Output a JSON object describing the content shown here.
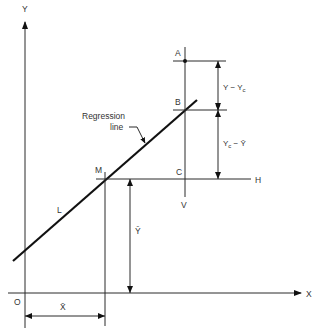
{
  "diagram": {
    "colors": {
      "line": "#111111",
      "thin": "#2a2a2a",
      "text": "#333333",
      "background": "#ffffff"
    },
    "axes": {
      "y_label": "Y",
      "x_label": "X",
      "origin_label": "O"
    },
    "points": {
      "A": "A",
      "B": "B",
      "C": "C",
      "M": "M"
    },
    "lines": {
      "regression_label_line1": "Regression",
      "regression_label_line2": "line",
      "line_L": "L",
      "horizontal_H": "H",
      "vertical_V": "V"
    },
    "dimensions": {
      "y_minus_yc": "Y − Y",
      "y_minus_yc_sub": "c",
      "yc_minus_ybar": "Y",
      "yc_minus_ybar_sub": "c",
      "yc_minus_ybar_rest": " − Ȳ",
      "y_bar": "Ȳ",
      "x_bar": "X̄"
    }
  }
}
